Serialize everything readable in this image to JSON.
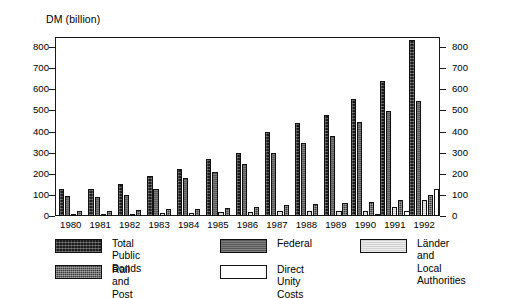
{
  "chart_data": {
    "type": "bar",
    "title": "",
    "ylabel": "DM (billion)",
    "xlabel": "",
    "ylim": [
      0,
      800
    ],
    "yticks": [
      0,
      100,
      200,
      300,
      400,
      500,
      600,
      700,
      800
    ],
    "ytick_labels": [
      "0",
      "100",
      "200",
      "300",
      "400",
      "500",
      "600",
      "700",
      "800"
    ],
    "right_axis": true,
    "right_ytick_labels": [
      "0",
      "100",
      "200",
      "300",
      "400",
      "500",
      "600",
      "700",
      "800"
    ],
    "grid": false,
    "legend_position": "bottom",
    "categories": [
      "1980",
      "1981",
      "1982",
      "1983",
      "1984",
      "1985",
      "1986",
      "1987",
      "1988",
      "1989",
      "1990",
      "1991",
      "1992"
    ],
    "series": [
      {
        "name": "Total Public Bonds",
        "color": "#1c1c1c",
        "values": [
          128,
          128,
          150,
          190,
          222,
          268,
          300,
          398,
          440,
          478,
          555,
          640,
          835
        ]
      },
      {
        "name": "Federal",
        "color": "#5a5a5a",
        "values": [
          93,
          88,
          100,
          128,
          178,
          210,
          245,
          300,
          345,
          378,
          445,
          495,
          545
        ]
      },
      {
        "name": "Länder and\nLocal Authorities",
        "color": "#d2d2d2",
        "values": [
          8,
          8,
          10,
          12,
          14,
          18,
          20,
          22,
          25,
          25,
          25,
          42,
          75
        ]
      },
      {
        "name": "Rail and Post",
        "color": "#3c3c3c",
        "values": [
          22,
          22,
          30,
          32,
          34,
          38,
          42,
          52,
          58,
          62,
          68,
          75,
          100
        ]
      },
      {
        "name": "Direct Unity Costs",
        "color": "#ffffff",
        "values": [
          0,
          0,
          0,
          0,
          0,
          0,
          0,
          0,
          0,
          0,
          10,
          25,
          130
        ]
      }
    ]
  },
  "legend": {
    "items": [
      {
        "label": "Total Public Bonds",
        "swatch": "total"
      },
      {
        "label": "Federal",
        "swatch": "federal"
      },
      {
        "label": "Länder and\nLocal Authorities",
        "swatch": "laender"
      },
      {
        "label": "Rail and Post",
        "swatch": "rail"
      },
      {
        "label": "Direct Unity Costs",
        "swatch": "unity"
      }
    ]
  }
}
